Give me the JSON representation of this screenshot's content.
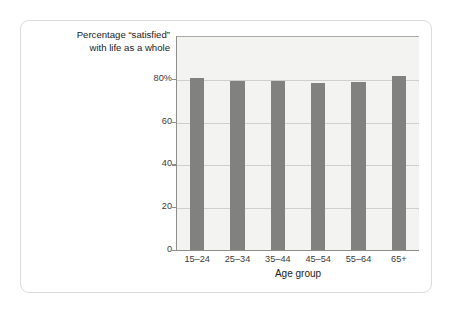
{
  "chart_data": {
    "type": "bar",
    "title": "",
    "caption_lines": [
      "Percentage “satisfied”",
      "with life as a whole"
    ],
    "categories": [
      "15–24",
      "25–34",
      "35–44",
      "45–54",
      "55–64",
      "65+"
    ],
    "values": [
      80.5,
      79.0,
      78.8,
      78.0,
      78.5,
      81.5
    ],
    "series": [
      {
        "name": "Percentage satisfied with life as a whole",
        "values": [
          80.5,
          79.0,
          78.8,
          78.0,
          78.5,
          81.5
        ]
      }
    ],
    "xlabel": "Age group",
    "ylabel": "",
    "ylim": [
      0,
      100
    ],
    "yticks": [
      0,
      20,
      40,
      60,
      80
    ],
    "ytick_labels": [
      "0",
      "20",
      "40",
      "60",
      "80%"
    ],
    "grid": true,
    "legend": false,
    "legend_position": "none",
    "bar_color": "#818180",
    "plot_background": "#f3f3f1",
    "gridline_color": "#cfcfcd",
    "axis_color": "#8e8e8c",
    "card_border_color": "#dcdcdc",
    "page_background": "#ffffff"
  }
}
